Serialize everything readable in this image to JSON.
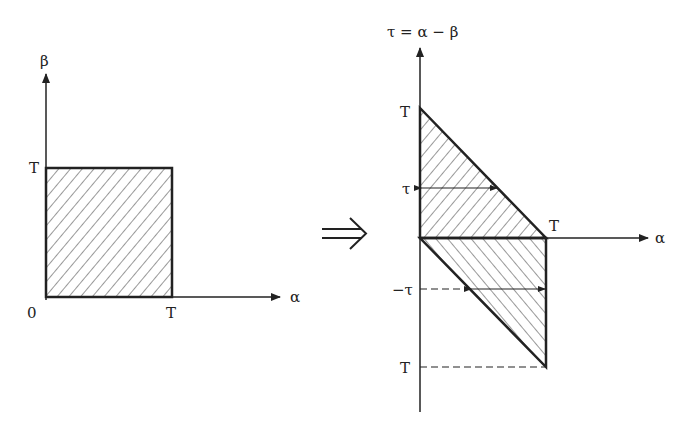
{
  "left_diagram": {
    "y_axis_label": "β",
    "x_axis_label": "α",
    "origin_label": "0",
    "y_tick_label": "T",
    "x_tick_label": "T",
    "region": "square [0,T]×[0,T], hatched"
  },
  "transform_arrow": "⇒",
  "right_diagram": {
    "y_axis_label": "τ = α − β",
    "x_axis_label": "α",
    "top_tick_label": "T",
    "tau_label": "τ",
    "x_tick_label": "T",
    "neg_tau_label": "−τ",
    "bottom_tick_label": "T",
    "regions": [
      "upper triangle (τ ≥ 0), hatched",
      "lower triangle (τ < 0), hatched"
    ]
  },
  "colors": {
    "line": "#222222",
    "background": "#ffffff"
  }
}
